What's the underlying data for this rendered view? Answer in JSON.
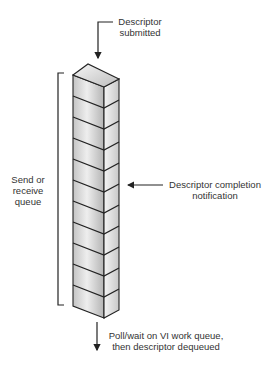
{
  "diagram": {
    "title": "",
    "labels": {
      "top": [
        "Descriptor",
        "submitted"
      ],
      "left": [
        "Send or",
        "receive",
        "queue"
      ],
      "right": [
        "Descriptor completion",
        "notification"
      ],
      "bottom": [
        "Poll/wait on VI work queue,",
        "then descriptor dequeued"
      ]
    },
    "queue": {
      "segment_count": 11,
      "description": "Vertical stack of descriptor slots forming a work queue"
    },
    "colors": {
      "line": "#222222",
      "face_front_light": "#f2f2f2",
      "face_front_dark": "#b8b8b8",
      "face_side": "#d6d6d6",
      "text": "#333333"
    }
  }
}
